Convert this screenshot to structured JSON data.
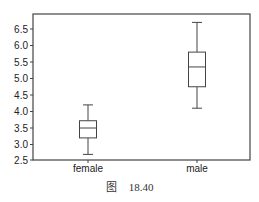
{
  "caption": {
    "prefix": "图",
    "number": "18.40"
  },
  "chart_data": {
    "type": "boxplot",
    "title": "",
    "xlabel": "",
    "ylabel": "",
    "categories": [
      "female",
      "male"
    ],
    "ylim": [
      2.5,
      6.9
    ],
    "yticks": [
      2.5,
      3.0,
      3.5,
      4.0,
      4.5,
      5.0,
      5.5,
      6.0,
      6.5
    ],
    "ytick_labels": [
      "2.5",
      "3.0",
      "3.5",
      "4.0",
      "4.5",
      "5.0",
      "5.5",
      "6.0",
      "6.5"
    ],
    "grid": false,
    "legend": null,
    "boxes": [
      {
        "category": "female",
        "whisker_low": 2.7,
        "q1": 3.2,
        "median": 3.5,
        "q3": 3.72,
        "whisker_high": 4.2
      },
      {
        "category": "male",
        "whisker_low": 4.1,
        "q1": 4.75,
        "median": 5.35,
        "q3": 5.8,
        "whisker_high": 6.7
      }
    ]
  },
  "style": {
    "axis_color": "#444444",
    "box_color": "#444444"
  }
}
